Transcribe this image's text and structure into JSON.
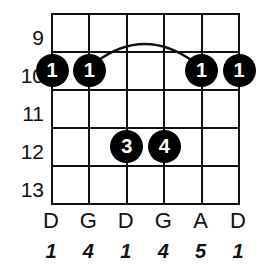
{
  "diagram": {
    "type": "guitar-chord-diagram",
    "colors": {
      "background": "#ffffff",
      "line": "#111111",
      "dot_fill": "#000000",
      "dot_text": "#ffffff"
    },
    "fret_labels": [
      "9",
      "10",
      "11",
      "12",
      "13"
    ],
    "string_count": 6,
    "fret_row_count": 5,
    "notes": [
      "D",
      "G",
      "D",
      "G",
      "A",
      "D"
    ],
    "intervals": [
      "1",
      "4",
      "1",
      "4",
      "5",
      "1"
    ],
    "dots": [
      {
        "label": "1",
        "string": 1,
        "fret": "10"
      },
      {
        "label": "1",
        "string": 2,
        "fret": "10"
      },
      {
        "label": "1",
        "string": 5,
        "fret": "10"
      },
      {
        "label": "1",
        "string": 6,
        "fret": "10"
      },
      {
        "label": "3",
        "string": 3,
        "fret": "12"
      },
      {
        "label": "4",
        "string": 4,
        "fret": "12"
      }
    ],
    "barre": {
      "fret": "10",
      "from_string": 2,
      "to_string": 5
    }
  }
}
